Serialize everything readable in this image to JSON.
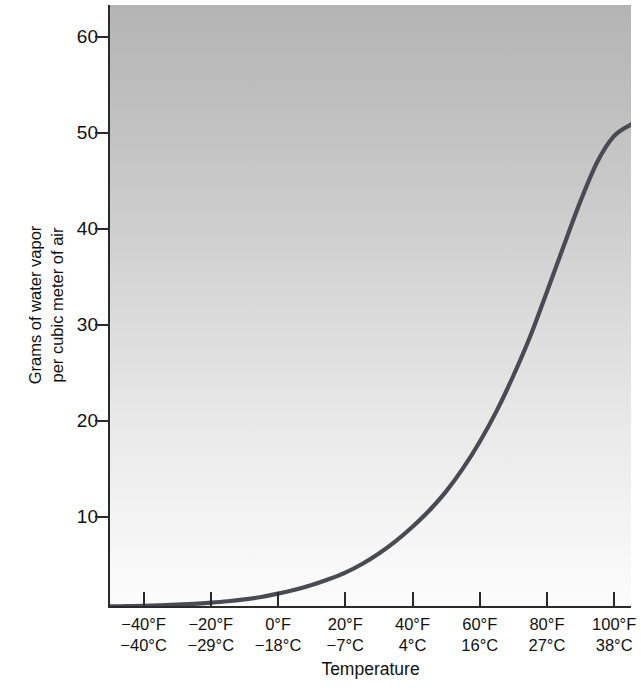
{
  "chart_data": {
    "type": "line",
    "title": "",
    "xlabel": "Temperature",
    "ylabel": "Grams of water vapor per cubic meter of air",
    "ylabel_lines": [
      "Grams of water vapor",
      "per cubic meter of air"
    ],
    "grid": false,
    "legend": "none",
    "xlim_f": [
      -50,
      105
    ],
    "ylim": [
      0,
      63
    ],
    "y_ticks": [
      10,
      20,
      30,
      40,
      50,
      60
    ],
    "x_ticks_f": [
      -40,
      -20,
      0,
      20,
      40,
      60,
      80,
      100
    ],
    "x_tick_labels": [
      {
        "f": "−40°F",
        "c": "−40°C"
      },
      {
        "f": "−20°F",
        "c": "−29°C"
      },
      {
        "f": "0°F",
        "c": "−18°C"
      },
      {
        "f": "20°F",
        "c": "−7°C"
      },
      {
        "f": "40°F",
        "c": "4°C"
      },
      {
        "f": "60°F",
        "c": "16°C"
      },
      {
        "f": "80°F",
        "c": "27°C"
      },
      {
        "f": "100°F",
        "c": "38°C"
      }
    ],
    "series": [
      {
        "name": "Saturation water vapor capacity",
        "x_units": "°F",
        "y_units": "g/m³",
        "x": [
          -50,
          -45,
          -40,
          -35,
          -30,
          -25,
          -20,
          -15,
          -10,
          -5,
          0,
          5,
          10,
          15,
          20,
          25,
          30,
          35,
          40,
          45,
          50,
          55,
          60,
          65,
          70,
          75,
          80,
          85,
          90,
          95,
          100,
          105
        ],
        "values": [
          0.06,
          0.09,
          0.12,
          0.17,
          0.24,
          0.33,
          0.45,
          0.6,
          0.8,
          1.05,
          1.4,
          1.8,
          2.3,
          2.9,
          3.6,
          4.5,
          5.6,
          6.9,
          8.4,
          10.1,
          12.1,
          14.5,
          17.3,
          20.5,
          24.2,
          28.3,
          33.0,
          37.8,
          42.5,
          46.6,
          49.3,
          50.5
        ]
      }
    ],
    "colors": {
      "curve": "#4a4a52",
      "axis": "#2a2a2a",
      "plot_bg_top": "#b4b4b4",
      "plot_bg_bottom": "#fbfbfb",
      "text": "#111111"
    }
  },
  "axes": {
    "y_title_line1": "Grams of water vapor",
    "y_title_line2": "per cubic meter of air",
    "x_title": "Temperature",
    "y_tick_labels": [
      "60",
      "50",
      "40",
      "30",
      "20",
      "10"
    ]
  }
}
